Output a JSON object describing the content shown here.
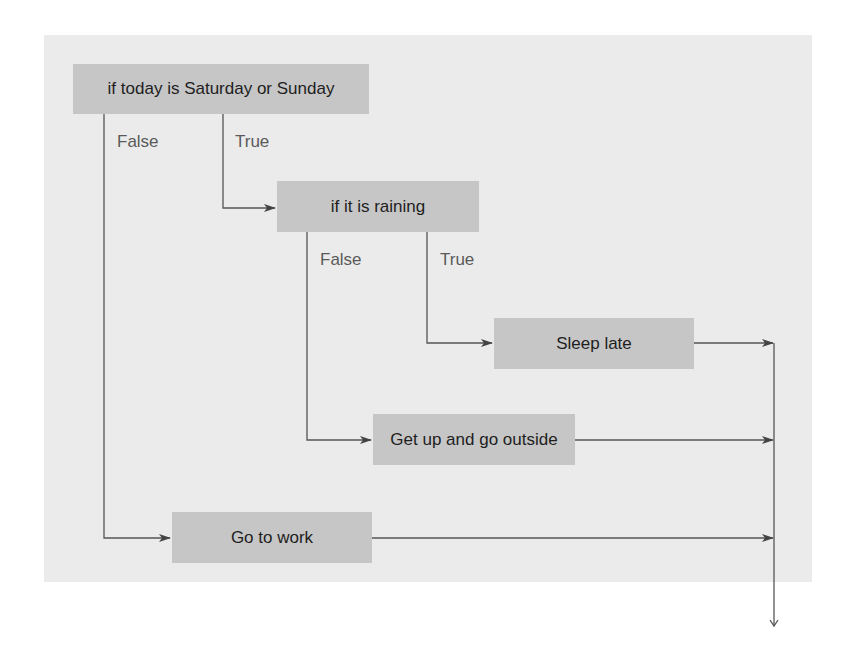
{
  "diagram": {
    "type": "flowchart",
    "nodes": {
      "weekend_check": {
        "text": "if today is Saturday or Sunday",
        "kind": "decision"
      },
      "rain_check": {
        "text": "if it is raining",
        "kind": "decision"
      },
      "sleep_late": {
        "text": "Sleep late",
        "kind": "action"
      },
      "go_outside": {
        "text": "Get up and go outside",
        "kind": "action"
      },
      "go_to_work": {
        "text": "Go to work",
        "kind": "action"
      }
    },
    "labels": {
      "weekend_false": "False",
      "weekend_true": "True",
      "rain_false": "False",
      "rain_true": "True"
    },
    "edges": [
      {
        "from": "weekend_check",
        "to": "rain_check",
        "label": "True"
      },
      {
        "from": "weekend_check",
        "to": "go_to_work",
        "label": "False"
      },
      {
        "from": "rain_check",
        "to": "sleep_late",
        "label": "True"
      },
      {
        "from": "rain_check",
        "to": "go_outside",
        "label": "False"
      },
      {
        "from": "sleep_late",
        "to": "merge"
      },
      {
        "from": "go_outside",
        "to": "merge"
      },
      {
        "from": "go_to_work",
        "to": "merge"
      }
    ],
    "colors": {
      "panel": "#ebebeb",
      "node": "#c6c6c6",
      "node_text": "#1e1e1e",
      "label_text": "#5a5a5a",
      "line": "#555555"
    }
  }
}
